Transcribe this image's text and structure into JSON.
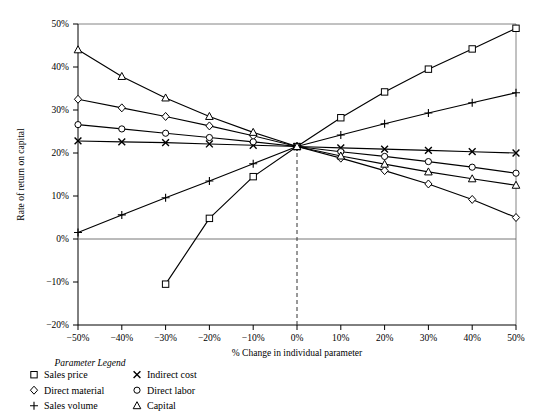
{
  "chart_data": {
    "type": "line",
    "title": "",
    "xlabel": "% Change in individual parameter",
    "ylabel": "Rate of return on capital",
    "x": [
      -50,
      -40,
      -30,
      -20,
      -10,
      0,
      10,
      20,
      30,
      40,
      50
    ],
    "xtick_labels": [
      "−50%",
      "−40%",
      "−30%",
      "−20%",
      "−10%",
      "0%",
      "10%",
      "20%",
      "30%",
      "40%",
      "50%"
    ],
    "ytick_labels": [
      "50%",
      "40%",
      "30%",
      "20%",
      "10%",
      "0%",
      "−10%",
      "−20%"
    ],
    "yticks": [
      50,
      40,
      30,
      20,
      10,
      0,
      -10,
      -20
    ],
    "xlim": [
      -50,
      50
    ],
    "ylim": [
      -20,
      50
    ],
    "grid": false,
    "legend_position": "below-left",
    "reference_line_x": 0,
    "zero_line_y": 0,
    "series": [
      {
        "name": "Sales price",
        "marker": "square",
        "x": [
          -30,
          -20,
          -10,
          0,
          10,
          20,
          30,
          40,
          50
        ],
        "values": [
          -10.5,
          4.8,
          14.5,
          21.5,
          28.2,
          34.2,
          39.5,
          44.2,
          49.0
        ]
      },
      {
        "name": "Indirect cost",
        "marker": "x",
        "x": [
          -50,
          -40,
          -30,
          -20,
          -10,
          0,
          10,
          20,
          30,
          40,
          50
        ],
        "values": [
          22.8,
          22.6,
          22.4,
          22.1,
          21.8,
          21.5,
          21.2,
          20.9,
          20.6,
          20.3,
          20.0
        ]
      },
      {
        "name": "Direct material",
        "marker": "diamond",
        "x": [
          -50,
          -40,
          -30,
          -20,
          -10,
          0,
          10,
          20,
          30,
          40,
          50
        ],
        "values": [
          32.5,
          30.5,
          28.5,
          26.3,
          24.0,
          21.5,
          18.8,
          15.9,
          12.8,
          9.2,
          5.0
        ]
      },
      {
        "name": "Direct labor",
        "marker": "circle",
        "x": [
          -50,
          -40,
          -30,
          -20,
          -10,
          0,
          10,
          20,
          30,
          40,
          50
        ],
        "values": [
          26.6,
          25.6,
          24.6,
          23.6,
          22.6,
          21.5,
          20.3,
          19.2,
          18.0,
          16.7,
          15.3
        ]
      },
      {
        "name": "Sales volume",
        "marker": "plus",
        "x": [
          -50,
          -40,
          -30,
          -20,
          -10,
          0,
          10,
          20,
          30,
          40,
          50
        ],
        "values": [
          1.5,
          5.6,
          9.6,
          13.5,
          17.5,
          21.5,
          24.2,
          26.8,
          29.3,
          31.7,
          34.0
        ]
      },
      {
        "name": "Capital",
        "marker": "triangle",
        "x": [
          -50,
          -40,
          -30,
          -20,
          -10,
          0,
          10,
          20,
          30,
          40,
          50
        ],
        "values": [
          44.0,
          37.8,
          32.8,
          28.5,
          24.8,
          21.5,
          19.3,
          17.4,
          15.6,
          14.0,
          12.5
        ]
      }
    ]
  },
  "legend": {
    "title": "Parameter Legend",
    "column_left": [
      {
        "marker": "square",
        "label": "Sales price"
      },
      {
        "marker": "diamond",
        "label": "Direct material"
      },
      {
        "marker": "plus",
        "label": "Sales volume"
      }
    ],
    "column_right": [
      {
        "marker": "x",
        "label": "Indirect cost"
      },
      {
        "marker": "circle",
        "label": "Direct labor"
      },
      {
        "marker": "triangle",
        "label": "Capital"
      }
    ]
  }
}
